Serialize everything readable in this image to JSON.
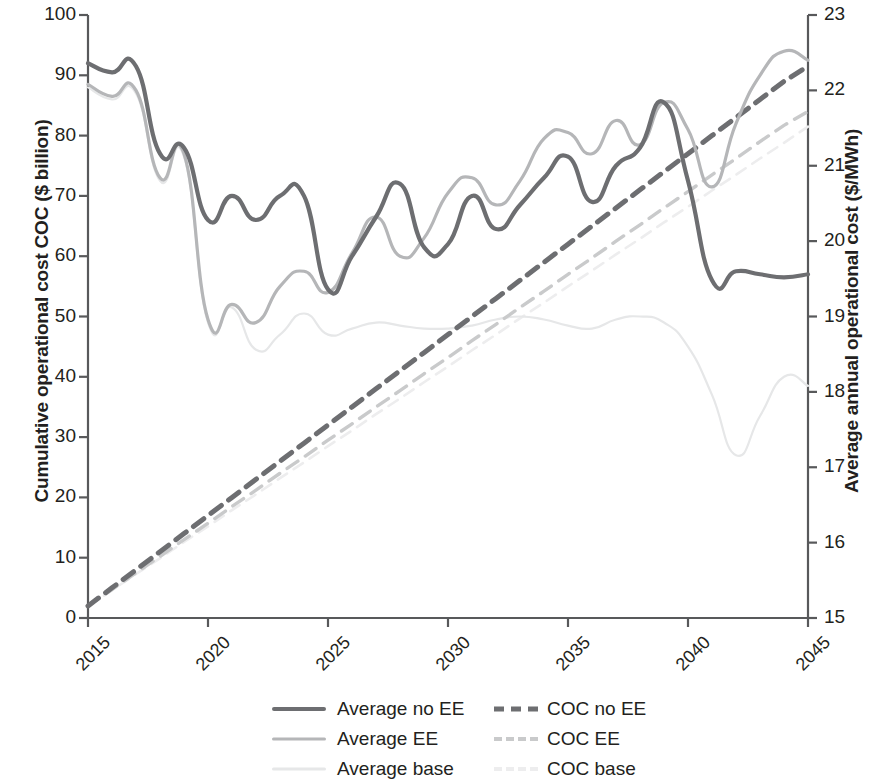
{
  "axes": {
    "y_left": {
      "title": "Cumulative operational cost COC ($ billion)",
      "ticks": [
        "0",
        "10",
        "20",
        "30",
        "40",
        "50",
        "60",
        "70",
        "80",
        "90",
        "100"
      ],
      "min": 0,
      "max": 100
    },
    "y_right": {
      "title": "Average annual operational cost ($/MWh)",
      "ticks": [
        "15",
        "16",
        "17",
        "18",
        "19",
        "20",
        "21",
        "22",
        "23"
      ],
      "min": 15,
      "max": 23
    },
    "x": {
      "ticks": [
        "2015",
        "2020",
        "2025",
        "2030",
        "2035",
        "2040",
        "2045"
      ],
      "min": 2015,
      "max": 2045
    }
  },
  "legend": {
    "rows": [
      [
        {
          "label": "Average no EE",
          "style": "solid",
          "color": "#6d6e71",
          "name": "average-no-ee"
        },
        {
          "label": "COC no  EE",
          "style": "dashed",
          "color": "#6d6e71",
          "name": "coc-no-ee"
        }
      ],
      [
        {
          "label": "Average EE",
          "style": "solid",
          "color": "#b5b6b8",
          "name": "average-ee"
        },
        {
          "label": "COC EE",
          "style": "dashed",
          "color": "#c9cacb",
          "name": "coc-ee"
        }
      ],
      [
        {
          "label": "Average  base",
          "style": "solid",
          "color": "#e6e7e8",
          "name": "average-base"
        },
        {
          "label": "COC base",
          "style": "dashed",
          "color": "#ededee",
          "name": "coc-base"
        }
      ]
    ]
  },
  "colors": {
    "dark": "#6d6e71",
    "mid": "#b5b6b8",
    "mid_dash": "#c9cacb",
    "light": "#e6e7e8",
    "light_dash": "#ededee",
    "axis": "#58595b",
    "text": "#231f20"
  },
  "chart_data": {
    "type": "line",
    "title": "",
    "xlabel": "",
    "ylabel": "Cumulative operational cost COC ($ billion)",
    "y2label": "Average annual operational cost ($/MWh)",
    "xlim": [
      2015,
      2045
    ],
    "ylim": [
      0,
      100
    ],
    "y2lim": [
      15,
      23
    ],
    "grid": false,
    "legend_position": "bottom",
    "x": [
      2015,
      2016,
      2017,
      2018,
      2019,
      2020,
      2021,
      2022,
      2023,
      2024,
      2025,
      2026,
      2027,
      2028,
      2029,
      2030,
      2031,
      2032,
      2033,
      2034,
      2035,
      2036,
      2037,
      2038,
      2039,
      2040,
      2041,
      2042,
      2043,
      2044,
      2045
    ],
    "series": [
      {
        "name": "Average no EE",
        "axis": "left",
        "style": "solid",
        "color": "#6d6e71",
        "values": [
          92.0,
          90.5,
          91.5,
          77.0,
          78.0,
          66.0,
          70.0,
          66.0,
          70.0,
          70.0,
          54.5,
          60.0,
          66.5,
          72.0,
          61.5,
          62.0,
          70.0,
          64.5,
          68.5,
          73.0,
          76.5,
          69.0,
          75.0,
          78.0,
          85.5,
          72.5,
          56.0,
          57.5,
          57.0,
          56.5,
          57.0
        ]
      },
      {
        "name": "Average EE",
        "axis": "left",
        "style": "solid",
        "color": "#b5b6b8",
        "values": [
          88.5,
          86.5,
          87.5,
          73.0,
          77.0,
          49.5,
          52.0,
          49.0,
          55.0,
          57.5,
          54.0,
          60.5,
          66.5,
          60.0,
          63.0,
          70.5,
          73.0,
          68.5,
          72.5,
          79.5,
          80.5,
          77.0,
          82.5,
          78.5,
          85.5,
          81.0,
          71.5,
          82.0,
          90.0,
          94.0,
          92.5
        ]
      },
      {
        "name": "Average base",
        "axis": "left",
        "style": "solid",
        "color": "#e6e7e8",
        "values": [
          88.0,
          86.0,
          87.0,
          72.5,
          76.5,
          49.0,
          51.5,
          44.5,
          47.0,
          50.5,
          47.0,
          48.0,
          49.0,
          48.5,
          48.0,
          48.0,
          48.5,
          49.5,
          50.0,
          49.5,
          48.5,
          48.0,
          49.5,
          50.0,
          49.0,
          45.0,
          37.0,
          27.0,
          33.5,
          40.0,
          38.5
        ]
      },
      {
        "name": "COC no EE",
        "axis": "left",
        "style": "dashed",
        "color": "#6d6e71",
        "values": [
          2.0,
          5.0,
          8.0,
          11.0,
          14.0,
          17.0,
          20.0,
          23.0,
          26.0,
          29.0,
          32.0,
          35.0,
          38.0,
          41.0,
          44.0,
          47.0,
          50.0,
          53.0,
          56.0,
          59.0,
          62.0,
          65.0,
          68.0,
          71.0,
          74.0,
          77.0,
          80.0,
          83.0,
          86.0,
          89.0,
          91.5
        ]
      },
      {
        "name": "COC EE",
        "axis": "left",
        "style": "dashed",
        "color": "#c9cacb",
        "values": [
          2.0,
          4.7,
          7.5,
          10.2,
          13.0,
          15.7,
          18.5,
          21.2,
          24.0,
          26.7,
          29.5,
          32.2,
          35.0,
          37.7,
          40.5,
          43.2,
          46.0,
          48.7,
          51.5,
          54.2,
          57.0,
          59.7,
          62.5,
          65.2,
          68.0,
          70.7,
          73.5,
          76.2,
          79.0,
          81.7,
          84.0
        ]
      },
      {
        "name": "COC base",
        "axis": "left",
        "style": "dashed",
        "color": "#ededee",
        "values": [
          2.0,
          4.6,
          7.3,
          9.9,
          12.6,
          15.2,
          17.9,
          20.5,
          23.2,
          25.8,
          28.5,
          31.1,
          33.8,
          36.4,
          39.1,
          41.7,
          44.4,
          47.0,
          49.7,
          52.3,
          55.0,
          57.6,
          60.3,
          62.9,
          65.6,
          68.2,
          70.9,
          73.5,
          76.2,
          78.8,
          81.5
        ]
      }
    ]
  }
}
